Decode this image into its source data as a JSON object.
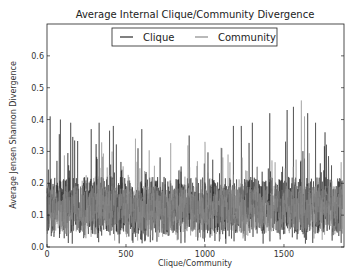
{
  "chart_data": {
    "type": "line",
    "title": "Average Internal Clique/Community Divergence",
    "xlabel": "Clique/Community",
    "ylabel": "Average Jensen Shannon Divergence",
    "xlim": [
      0,
      1880
    ],
    "ylim": [
      0.0,
      0.7
    ],
    "xticks": [
      0,
      500,
      1000,
      1500
    ],
    "xtick_labels": [
      "0",
      "500",
      "1000",
      "1500"
    ],
    "yticks": [
      0.0,
      0.1,
      0.2,
      0.3,
      0.4,
      0.5,
      0.6
    ],
    "ytick_labels": [
      "0.0",
      "0.1",
      "0.2",
      "0.3",
      "0.4",
      "0.5",
      "0.6"
    ],
    "grid": false,
    "legend": {
      "placement": "top-center",
      "entries": [
        "Clique",
        "Community"
      ]
    },
    "series": [
      {
        "name": "Clique",
        "color": "#2b2b2b",
        "n_points": 1870,
        "typical_range": [
          0.05,
          0.25
        ],
        "mean": 0.13,
        "min": 0.01,
        "peaks": [
          [
            20,
            0.41
          ],
          [
            85,
            0.4
          ],
          [
            150,
            0.39
          ],
          [
            280,
            0.37
          ],
          [
            330,
            0.39
          ],
          [
            420,
            0.38
          ],
          [
            600,
            0.37
          ],
          [
            900,
            0.35
          ],
          [
            1180,
            0.38
          ],
          [
            1230,
            0.38
          ],
          [
            1300,
            0.39
          ],
          [
            1410,
            0.42
          ],
          [
            1520,
            0.43
          ],
          [
            1560,
            0.44
          ],
          [
            1650,
            0.42
          ],
          [
            1700,
            0.39
          ],
          [
            1760,
            0.36
          ]
        ]
      },
      {
        "name": "Community",
        "color": "#8a8a8a",
        "n_points": 1870,
        "typical_range": [
          0.06,
          0.22
        ],
        "mean": 0.12,
        "min": 0.02,
        "peaks": [
          [
            1610,
            0.46
          ],
          [
            1630,
            0.41
          ],
          [
            560,
            0.34
          ],
          [
            1000,
            0.33
          ]
        ]
      }
    ]
  }
}
